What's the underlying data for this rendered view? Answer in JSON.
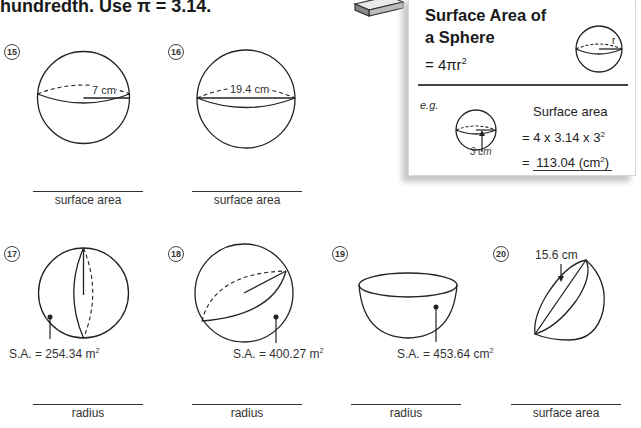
{
  "instruction": {
    "text": "hundredth.  Use π = 3.14."
  },
  "formula_box": {
    "title_line1": "Surface Area of",
    "title_line2": "a Sphere",
    "formula": "= 4πr",
    "formula_exponent": "2",
    "diagram_label": "r",
    "example": {
      "label": "e.g.",
      "heading": "Surface area",
      "step1": "= 4 x 3.14 x 3",
      "step1_exponent": "2",
      "step2_prefix": "=",
      "step2_value": "113.04 (cm",
      "step2_exponent": "2",
      "step2_suffix": ")",
      "radius_label": "3 cm"
    }
  },
  "questions": [
    {
      "number": "15",
      "circled": "⑮",
      "dimension_label": "7 cm",
      "dimension_type": "radius",
      "answer_label": "surface area"
    },
    {
      "number": "16",
      "circled": "⑯",
      "dimension_label": "19.4 cm",
      "dimension_type": "diameter",
      "answer_label": "surface area"
    },
    {
      "number": "17",
      "circled": "⑰",
      "given": "S.A. = 254.34 m",
      "given_exponent": "2",
      "answer_label": "radius"
    },
    {
      "number": "18",
      "circled": "⑱",
      "given": "S.A. = 400.27 m",
      "given_exponent": "2",
      "answer_label": "radius"
    },
    {
      "number": "19",
      "circled": "⑲",
      "given": "S.A. = 453.64 cm",
      "given_exponent": "2",
      "shape": "hemisphere",
      "answer_label": "radius"
    },
    {
      "number": "20",
      "circled": "⑳",
      "dimension_label": "15.6 cm",
      "shape": "hemisphere",
      "answer_label": "surface area"
    }
  ]
}
